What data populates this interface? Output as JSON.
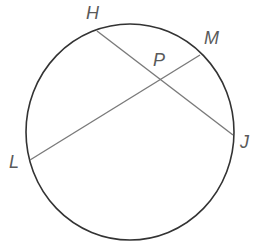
{
  "diagram": {
    "type": "circle-with-intersecting-chords",
    "circle": {
      "cx": 130,
      "cy": 132,
      "rx": 104,
      "ry": 108,
      "stroke": "#333333"
    },
    "chords": [
      {
        "name": "HJ",
        "from": "H",
        "to": "J",
        "stroke": "#7a7a7a"
      },
      {
        "name": "LM",
        "from": "L",
        "to": "M",
        "stroke": "#7a7a7a"
      }
    ],
    "points": {
      "H": {
        "x": 97,
        "y": 31
      },
      "M": {
        "x": 200,
        "y": 55
      },
      "J": {
        "x": 233,
        "y": 135
      },
      "L": {
        "x": 30,
        "y": 160
      },
      "P": {
        "x": 160,
        "y": 80
      }
    },
    "labels": {
      "H": "H",
      "M": "M",
      "P": "P",
      "J": "J",
      "L": "L"
    },
    "intersection_point": "P"
  }
}
